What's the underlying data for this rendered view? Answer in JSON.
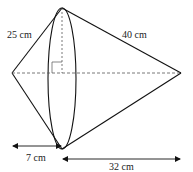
{
  "diagram": {
    "labels": {
      "left_slant": "25 cm",
      "right_slant": "40 cm",
      "left_height": "7 cm",
      "right_height": "32 cm"
    },
    "colors": {
      "line": "#111111",
      "dash": "#555555",
      "text": "#222222"
    }
  }
}
